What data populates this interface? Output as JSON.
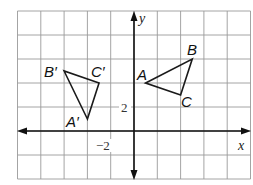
{
  "diagram": {
    "type": "coordinate-plane-transformation",
    "transformation": "rotation 90° counterclockwise about the origin",
    "grid": {
      "x_min": -10,
      "x_max": 10,
      "y_min": -4,
      "y_max": 10,
      "cell_units": 2
    },
    "axes": {
      "x_label": "x",
      "y_label": "y",
      "tick_labels": [
        {
          "axis": "y",
          "value": 2,
          "text": "2"
        },
        {
          "axis": "x",
          "value": -2,
          "text": "−2"
        }
      ]
    },
    "triangles": [
      {
        "name": "ABC",
        "role": "preimage",
        "vertices": [
          {
            "label": "A",
            "x": 1,
            "y": 4
          },
          {
            "label": "B",
            "x": 5,
            "y": 6
          },
          {
            "label": "C",
            "x": 4,
            "y": 3
          }
        ]
      },
      {
        "name": "A'B'C'",
        "role": "image",
        "vertices": [
          {
            "label": "A′",
            "x": -4,
            "y": 1
          },
          {
            "label": "B′",
            "x": -6,
            "y": 5
          },
          {
            "label": "C′",
            "x": -3,
            "y": 4
          }
        ]
      }
    ],
    "colors": {
      "grid": "#9a9a9a",
      "axis": "#111111",
      "triangle": "#1a1a1a",
      "background": "#ffffff"
    }
  }
}
